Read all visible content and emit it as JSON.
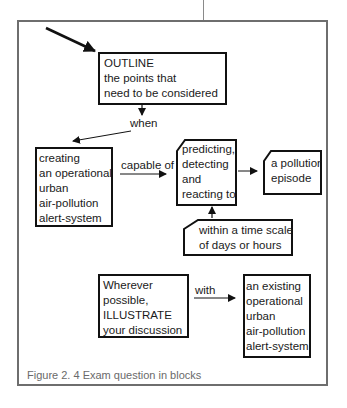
{
  "figure": {
    "caption": "Figure 2. 4  Exam question in blocks",
    "colors": {
      "frame": "#6e6e6e",
      "box_border": "#111111",
      "text": "#1a1a1a",
      "caption": "#6a6a6a"
    }
  },
  "blocks": {
    "outline": {
      "lines": [
        "OUTLINE",
        "the points that",
        "need to be considered"
      ]
    },
    "creating": {
      "lines": [
        "creating",
        "an operational",
        "urban",
        "air-pollution",
        "alert-system"
      ]
    },
    "predicting": {
      "lines": [
        "predicting,",
        "detecting",
        "and",
        "reacting to"
      ]
    },
    "pollution_episode": {
      "lines": [
        "a pollution",
        "episode"
      ]
    },
    "time_scale": {
      "lines": [
        "within a time scale",
        "of days or hours"
      ]
    },
    "illustrate": {
      "lines": [
        "Wherever",
        "possible,",
        "ILLUSTRATE",
        "your discussion"
      ]
    },
    "existing_system": {
      "lines": [
        "an existing",
        "operational",
        "urban",
        "air-pollution",
        "alert-system"
      ]
    }
  },
  "connectors": {
    "when": "when",
    "capable_of": "capable of",
    "with": "with"
  }
}
